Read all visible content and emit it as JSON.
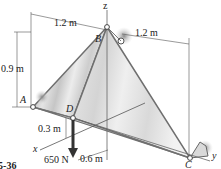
{
  "diagram": {
    "figure_label": "F5-36",
    "points": {
      "A": "A",
      "B": "B",
      "C": "C",
      "D": "D"
    },
    "axes": {
      "x": "x",
      "y": "y",
      "z": "z"
    },
    "dimensions": {
      "top_left": "1.2 m",
      "top_right": "1.2 m",
      "height": "0.9 m",
      "d_offset": "0.3 m",
      "bottom": "0.6 m"
    },
    "load": {
      "value": "650 N",
      "direction": "down",
      "applied_at": "D"
    },
    "colors": {
      "plate_light": "#e6e6e6",
      "plate_mid": "#cfcfcf",
      "plate_dark": "#b4b4b4",
      "edge": "#777777",
      "dim_line": "#555555",
      "force_arrow": "#333333"
    }
  }
}
